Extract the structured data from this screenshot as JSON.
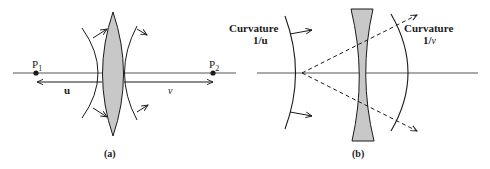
{
  "figure": {
    "panel_a": {
      "caption": "(a)",
      "point_left": {
        "label": "P",
        "subscript": "1"
      },
      "point_right": {
        "label": "P",
        "subscript": "2"
      },
      "distance_left_label": "u",
      "distance_right_label": "v",
      "lens_type": "converging (biconvex)"
    },
    "panel_b": {
      "caption": "(b)",
      "left_curvature": {
        "title": "Curvature",
        "value": "1/u"
      },
      "right_curvature": {
        "title": "Curvature",
        "value_prefix": "1/",
        "value_var": "v"
      },
      "lens_type": "diverging (biconcave)"
    },
    "colors": {
      "line": "#1a1a1a",
      "lens_fill": "#c8c8c8",
      "axis": "#555555"
    }
  }
}
